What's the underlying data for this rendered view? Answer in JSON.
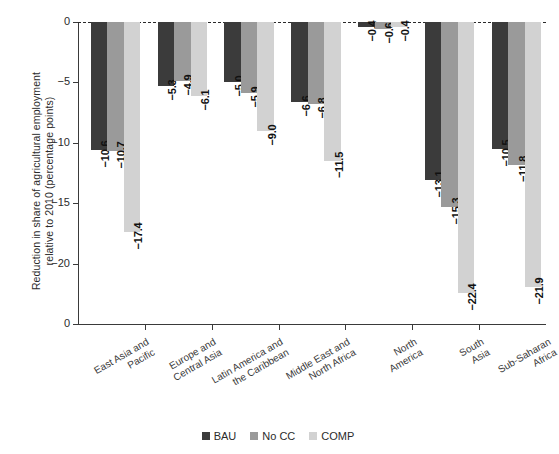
{
  "chart_data": {
    "type": "bar",
    "title": "",
    "xlabel": "",
    "ylabel": "Reduction in share of agricultural employment relative to 2010 (percentage points)",
    "ylim": [
      -25,
      0
    ],
    "yticks": [
      "0",
      "−5",
      "−10",
      "−15",
      "−20",
      "0"
    ],
    "ytick_values": [
      0,
      -5,
      -10,
      -15,
      -20,
      -25
    ],
    "grid": false,
    "legend_position": "bottom",
    "categories": [
      "East Asia and\nPacific",
      "Europe and\nCentral Asia",
      "Latin America and\nthe Caribbean",
      "Middle East and\nNorth Africa",
      "North\nAmerica",
      "South\nAsia",
      "Sub-Saharan\nAfrica"
    ],
    "series": [
      {
        "name": "BAU",
        "color": "#3b3b3b",
        "values": [
          -10.6,
          -5.3,
          -5.0,
          -6.6,
          -0.4,
          -13.1,
          -10.5
        ],
        "labels": [
          "−10.6",
          "−5.3",
          "−5.0",
          "−6.6",
          "−0.4",
          "−13.1",
          "−10.5"
        ]
      },
      {
        "name": "No CC",
        "color": "#9a9a9a",
        "values": [
          -10.7,
          -4.9,
          -5.9,
          -6.8,
          -0.6,
          -15.3,
          -11.8
        ],
        "labels": [
          "−10.7",
          "−4.9",
          "−5.9",
          "−6.8",
          "−0.6",
          "−15.3",
          "−11.8"
        ]
      },
      {
        "name": "COMP",
        "color": "#d2d2d2",
        "values": [
          -17.4,
          -6.1,
          -9.0,
          -11.5,
          -0.4,
          -22.4,
          -21.9
        ],
        "labels": [
          "−17.4",
          "−6.1",
          "−9.0",
          "−11.5",
          "−0.4",
          "−22.4",
          "−21.9"
        ]
      }
    ]
  },
  "legend": {
    "items": [
      {
        "label": "BAU",
        "color": "#3b3b3b"
      },
      {
        "label": "No CC",
        "color": "#9a9a9a"
      },
      {
        "label": "COMP",
        "color": "#d2d2d2"
      }
    ]
  }
}
